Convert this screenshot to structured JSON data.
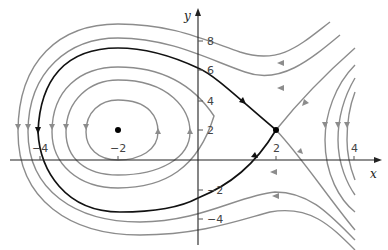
{
  "figure": {
    "type": "phase-portrait",
    "axes": {
      "x_label": "x",
      "y_label": "y",
      "x_ticks": [
        {
          "value": -4,
          "label": "−4"
        },
        {
          "value": -2,
          "label": "−2"
        },
        {
          "value": 2,
          "label": "2"
        },
        {
          "value": 4,
          "label": "4"
        }
      ],
      "y_ticks": [
        {
          "value": 8,
          "label": "8"
        },
        {
          "value": 6,
          "label": "6"
        },
        {
          "value": 4,
          "label": "4"
        },
        {
          "value": 2,
          "label": "2"
        },
        {
          "value": -2,
          "label": "−2"
        },
        {
          "value": -4,
          "label": "−4"
        }
      ]
    },
    "equilibria": [
      {
        "name": "center",
        "x": -2,
        "y": 2
      },
      {
        "name": "saddle",
        "x": 2,
        "y": 2
      }
    ],
    "colors": {
      "orbit": "#8c8c8c",
      "separatrix": "#111111",
      "axis": "#222222"
    }
  }
}
